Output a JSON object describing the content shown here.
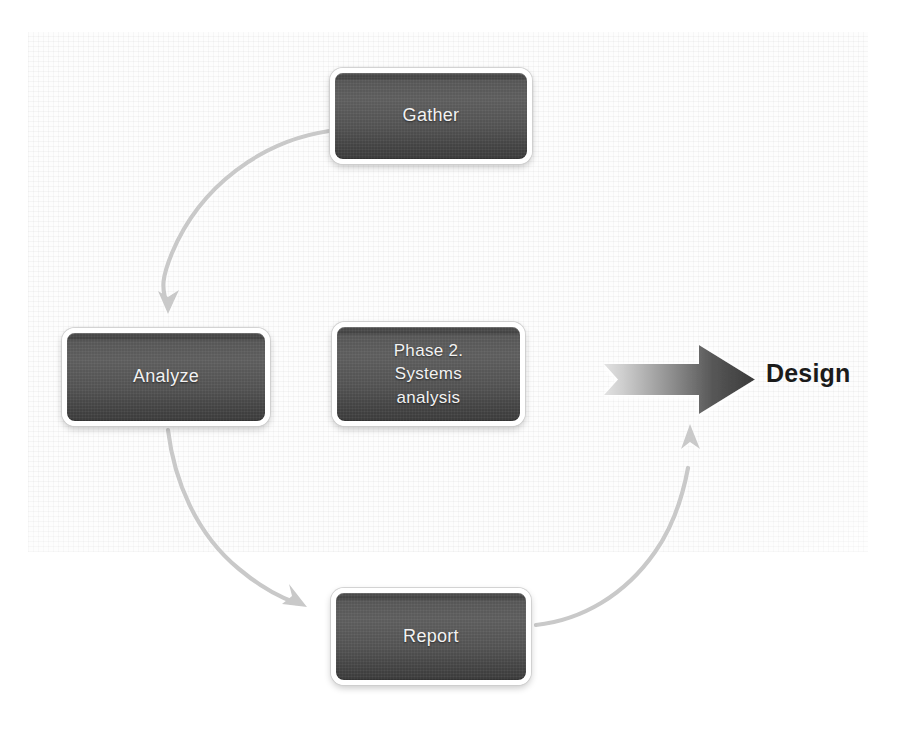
{
  "diagram": {
    "background_color": "#ffffff",
    "panel_color": "#fdfdfd",
    "node_fill_color": "#525252",
    "node_border_color": "#ffffff",
    "node_text_color": "#f2f2f2",
    "curve_arrow_color": "#c9c9c9",
    "straight_arrow_gradient_from": "#cfcfcf",
    "straight_arrow_gradient_to": "#3a3a3a",
    "caption_text_color": "#1b1b1b"
  },
  "nodes": [
    {
      "id": "gather",
      "label": "Gather"
    },
    {
      "id": "analyze",
      "label": "Analyze"
    },
    {
      "id": "phase",
      "label": "Phase 2.\nSystems\nanalysis"
    },
    {
      "id": "report",
      "label": "Report"
    }
  ],
  "connectors": [
    {
      "id": "gather-to-analyze",
      "from": "gather",
      "to": "analyze",
      "style": "curved-arrow",
      "direction": "down-left"
    },
    {
      "id": "analyze-to-report",
      "from": "analyze",
      "to": "report",
      "style": "curved-arrow",
      "direction": "down-right"
    },
    {
      "id": "report-to-design",
      "from": "report",
      "to": "design",
      "style": "curved-arrow",
      "direction": "up-right"
    },
    {
      "id": "design-arrow",
      "from": "cycle",
      "to": "design",
      "style": "block-arrow",
      "direction": "right"
    }
  ],
  "caption": {
    "design_label": "Design"
  }
}
